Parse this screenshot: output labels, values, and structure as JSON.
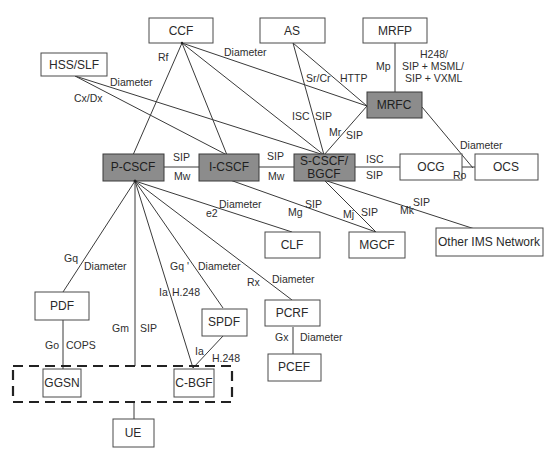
{
  "diagram": {
    "colors": {
      "core_fill": "#8c8c8c",
      "box_fill": "#ffffff",
      "line": "#3a3a3a"
    },
    "nodes": {
      "ccf": "CCF",
      "as": "AS",
      "mrfp": "MRFP",
      "hss": "HSS/SLF",
      "mrfc": "MRFC",
      "pcscf": "P-CSCF",
      "icscf": "I-CSCF",
      "scscf_line1": "S-CSCF/",
      "scscf_line2": "BGCF",
      "ocg": "OCG",
      "ocs": "OCS",
      "clf": "CLF",
      "mgcf": "MGCF",
      "other_ims": "Other IMS Network",
      "pdf": "PDF",
      "spdf": "SPDF",
      "pcrf": "PCRF",
      "pcef": "PCEF",
      "ggsn": "GGSN",
      "cbgf": "C-BGF",
      "ue": "UE"
    },
    "labels": {
      "rf": "Rf",
      "ccf_mrfc_diameter": "Diameter",
      "hss_diameter": "Diameter",
      "cxdx": "Cx/Dx",
      "srcr": "Sr/Cr",
      "http": "HTTP",
      "mp": "Mp",
      "mrfp_proto1": "H248/",
      "mrfp_proto2": "SIP + MSML/",
      "mrfp_proto3": "SIP + VXML",
      "isc_as": "ISC",
      "sip_as": "SIP",
      "mr": "Mr",
      "sip_mr": "SIP",
      "mrfc_ocs_diameter": "Diameter",
      "sip_p_i": "SIP",
      "mw_p_i": "Mw",
      "sip_i_s": "SIP",
      "mw_i_s": "Mw",
      "isc_ocg": "ISC",
      "sip_ocg": "SIP",
      "ro": "Ro",
      "e2_diameter": "Diameter",
      "e2": "e2",
      "mg": "Mg",
      "sip_mg": "SIP",
      "mj": "Mj",
      "sip_mj": "SIP",
      "mk": "Mk",
      "sip_mk": "SIP",
      "gq": "Gq",
      "gq_diameter": "Diameter",
      "gm": "Gm",
      "sip_gm": "SIP",
      "ia_top": "Ia",
      "h248_top": "H.248",
      "gq_prime": "Gq '",
      "gq_prime_diameter": "Diameter",
      "rx": "Rx",
      "rx_diameter": "Diameter",
      "go": "Go",
      "cops": "COPS",
      "ia_bottom": "Ia",
      "h248_bottom": "H.248",
      "gx": "Gx",
      "gx_diameter": "Diameter"
    }
  }
}
